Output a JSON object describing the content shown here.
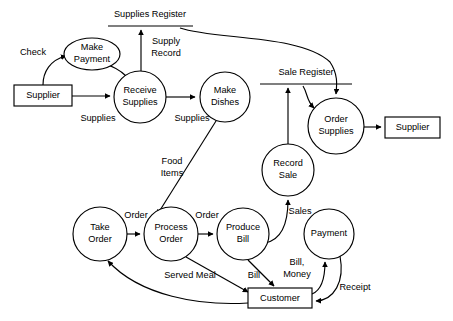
{
  "diagram": {
    "type": "data-flow-diagram",
    "colors": {
      "stroke": "#000000",
      "fill": "#ffffff",
      "background": "#ffffff"
    },
    "processes": [
      {
        "id": "make_payment",
        "label_line1": "Make",
        "label_line2": "Payment",
        "shape": "ellipse",
        "cx": 92,
        "cy": 54,
        "rx": 28,
        "ry": 16
      },
      {
        "id": "receive_supplies",
        "label_line1": "Receive",
        "label_line2": "Supplies",
        "shape": "circle",
        "cx": 140,
        "cy": 97,
        "rx": 26,
        "ry": 26
      },
      {
        "id": "make_dishes",
        "label_line1": "Make",
        "label_line2": "Dishes",
        "shape": "circle",
        "cx": 225,
        "cy": 97,
        "rx": 25,
        "ry": 25
      },
      {
        "id": "order_supplies",
        "label_line1": "Order",
        "label_line2": "Supplies",
        "shape": "circle",
        "cx": 336,
        "cy": 126,
        "rx": 28,
        "ry": 28
      },
      {
        "id": "record_sale",
        "label_line1": "Record",
        "label_line2": "Sale",
        "shape": "circle",
        "cx": 288,
        "cy": 170,
        "rx": 26,
        "ry": 26
      },
      {
        "id": "take_order",
        "label_line1": "Take",
        "label_line2": "Order",
        "shape": "circle",
        "cx": 100,
        "cy": 234,
        "rx": 27,
        "ry": 27
      },
      {
        "id": "process_order",
        "label_line1": "Process",
        "label_line2": "Order",
        "shape": "circle",
        "cx": 171,
        "cy": 234,
        "rx": 27,
        "ry": 27
      },
      {
        "id": "produce_bill",
        "label_line1": "Produce",
        "label_line2": "Bill",
        "shape": "circle",
        "cx": 243,
        "cy": 234,
        "rx": 26,
        "ry": 26
      },
      {
        "id": "payment",
        "label_line1": "Payment",
        "label_line2": "",
        "shape": "circle",
        "cx": 329,
        "cy": 234,
        "rx": 25,
        "ry": 25
      }
    ],
    "externals": [
      {
        "id": "supplier_left",
        "label": "Supplier",
        "x": 14,
        "y": 85,
        "w": 58,
        "h": 21
      },
      {
        "id": "supplier_right",
        "label": "Supplier",
        "x": 385,
        "y": 117,
        "w": 55,
        "h": 21
      },
      {
        "id": "customer",
        "label": "Customer",
        "x": 248,
        "y": 288,
        "w": 64,
        "h": 20
      }
    ],
    "datastores": [
      {
        "id": "supplies_register",
        "label": "Supplies Register",
        "label_x": 150,
        "label_y": 15,
        "line_x1": 108,
        "line_x2": 193,
        "line_y": 26
      },
      {
        "id": "sale_register",
        "label": "Sale Register",
        "label_x": 306,
        "label_y": 73,
        "line_x1": 260,
        "line_x2": 352,
        "line_y": 84
      }
    ],
    "flows": [
      {
        "id": "check",
        "label": "Check",
        "label_x": 33,
        "label_y": 53,
        "from": "supplier_left",
        "to": "make_payment"
      },
      {
        "id": "supplies_in",
        "label": "Supplies",
        "label_x": 98,
        "label_y": 119,
        "from": "supplier_left",
        "to": "receive_supplies"
      },
      {
        "id": "supplies_out",
        "label": "Supplies",
        "label_x": 192,
        "label_y": 119,
        "from": "receive_supplies",
        "to": "make_dishes"
      },
      {
        "id": "supply_record",
        "label_line1": "Supply",
        "label_line2": "Record",
        "label_x": 166,
        "label_y": 48,
        "from": "receive_supplies",
        "to": "supplies_register"
      },
      {
        "id": "reg_to_order",
        "label": "",
        "from": "supplies_register",
        "to": "order_supplies"
      },
      {
        "id": "sale_to_order",
        "label": "",
        "from": "sale_register",
        "to": "order_supplies"
      },
      {
        "id": "order_to_sup",
        "label": "",
        "from": "order_supplies",
        "to": "supplier_right"
      },
      {
        "id": "food_items",
        "label_line1": "Food",
        "label_line2": "Items",
        "label_x": 172,
        "label_y": 168,
        "from": "make_dishes",
        "to": "process_order"
      },
      {
        "id": "order1",
        "label": "Order",
        "label_x": 136,
        "label_y": 216,
        "from": "take_order",
        "to": "process_order"
      },
      {
        "id": "order2",
        "label": "Order",
        "label_x": 207,
        "label_y": 216,
        "from": "process_order",
        "to": "produce_bill"
      },
      {
        "id": "sales",
        "label": "Sales",
        "label_x": 298,
        "label_y": 212,
        "from": "produce_bill",
        "to": "record_sale"
      },
      {
        "id": "record_to_reg",
        "label": "",
        "from": "record_sale",
        "to": "sale_register"
      },
      {
        "id": "served_meal",
        "label": "Served Meal",
        "label_x": 190,
        "label_y": 276,
        "from": "process_order",
        "to": "customer"
      },
      {
        "id": "bill",
        "label": "Bill",
        "label_x": 254,
        "label_y": 276,
        "from": "produce_bill",
        "to": "customer"
      },
      {
        "id": "bill_money",
        "label_line1": "Bill,",
        "label_line2": "Money",
        "label_x": 297,
        "label_y": 269,
        "from": "customer",
        "to": "payment"
      },
      {
        "id": "receipt",
        "label": "Receipt",
        "label_x": 350,
        "label_y": 288,
        "from": "payment",
        "to": "customer"
      },
      {
        "id": "payment_flow",
        "label": "",
        "from": "receive_supplies",
        "to": "make_payment"
      },
      {
        "id": "meal_return",
        "label": "",
        "from": "customer",
        "to": "take_order"
      }
    ]
  }
}
